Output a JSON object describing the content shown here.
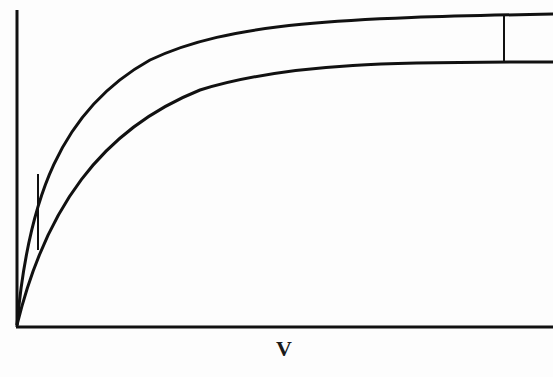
{
  "diagram": {
    "xlabel": "V",
    "ylabel": "",
    "curves": [
      {
        "name": "upper-saturation-curve",
        "description": "steeper saturating curve (higher asymptote)"
      },
      {
        "name": "lower-saturation-curve",
        "description": "less steep saturating curve (lower asymptote)"
      }
    ],
    "markers": [
      {
        "name": "low-V-difference-segment",
        "description": "vertical segment between curves near origin"
      },
      {
        "name": "high-V-difference-segment",
        "description": "vertical segment between curves at large V"
      }
    ],
    "colors": {
      "line": "#111111",
      "background": "#fdfdfd"
    }
  }
}
